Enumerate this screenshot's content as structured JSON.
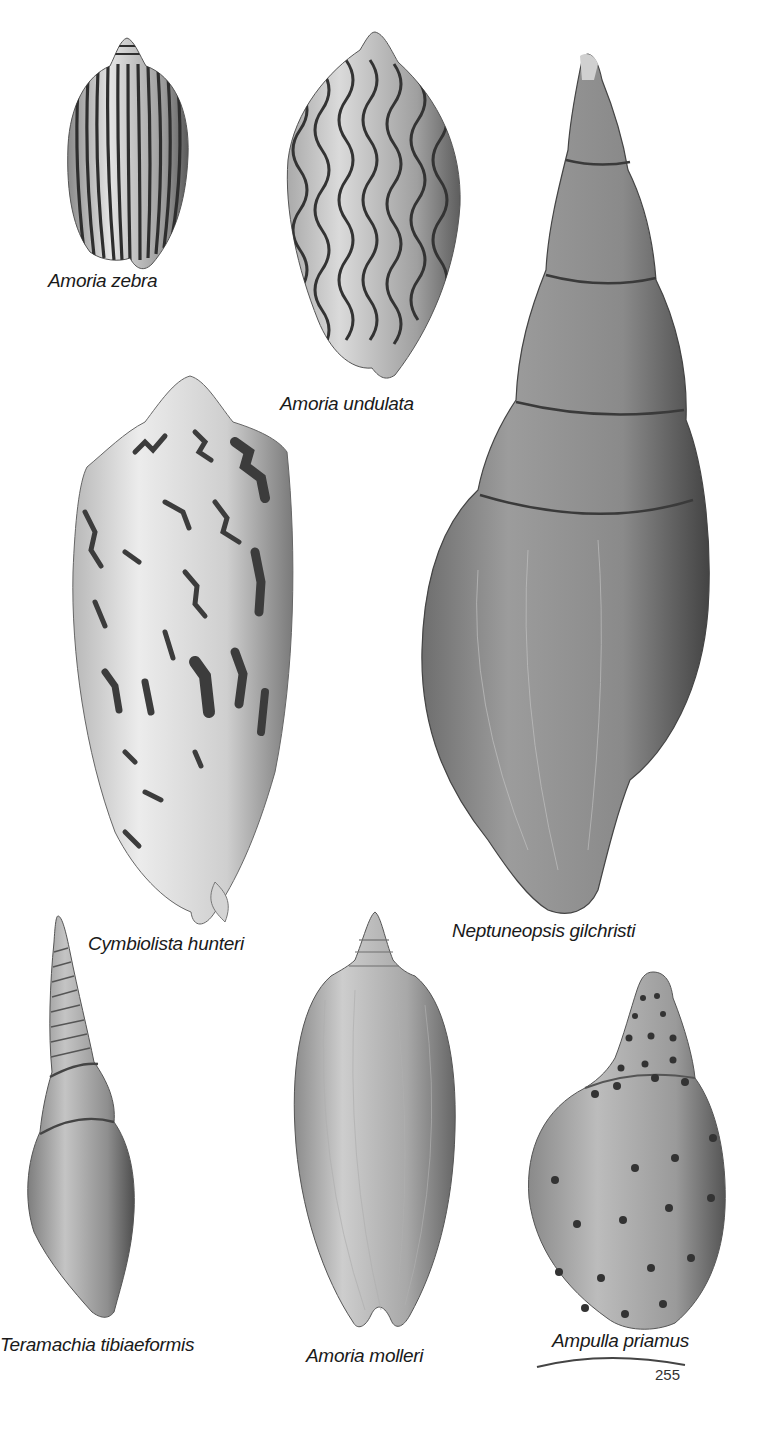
{
  "page": {
    "type": "illustrated-plate",
    "background": "#ffffff",
    "page_number": "255"
  },
  "specimens": [
    {
      "name": "Amoria zebra",
      "pattern": "vertical-stripes"
    },
    {
      "name": "Amoria undulata",
      "pattern": "wavy-lines"
    },
    {
      "name": "Neptuneopsis gilchristi",
      "pattern": "plain-whorled"
    },
    {
      "name": "Cymbiolista hunteri",
      "pattern": "zigzag-blotches"
    },
    {
      "name": "Teramachia tibiaeformis",
      "pattern": "plain-ribbed-spire"
    },
    {
      "name": "Amoria molleri",
      "pattern": "plain-fine-lines"
    },
    {
      "name": "Ampulla priamus",
      "pattern": "dotted-spiral-rows"
    }
  ],
  "captions": {
    "amoria_zebra": "Amoria zebra",
    "amoria_undulata": "Amoria undulata",
    "neptuneopsis": "Neptuneopsis gilchristi",
    "cymbiolista": "Cymbiolista hunteri",
    "teramachia": "Teramachia tibiaeformis",
    "amoria_molleri": "Amoria molleri",
    "ampulla": "Ampulla priamus"
  },
  "colors": {
    "shell_light": "#d6d6d6",
    "shell_mid": "#9a9a9a",
    "shell_dark": "#4a4a4a",
    "pattern": "#3a3a3a",
    "text": "#1a1a1a"
  }
}
